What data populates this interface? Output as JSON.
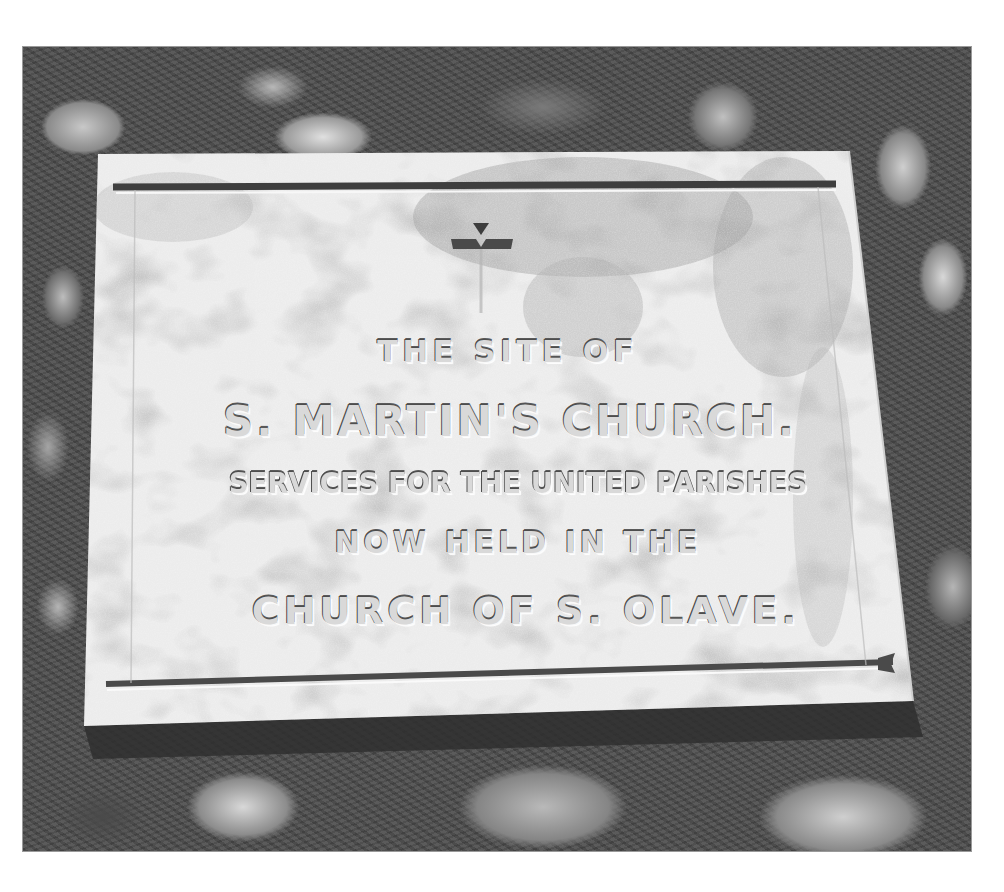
{
  "image": {
    "description": "Black-and-white photograph of a weathered carved stone plaque set into a flint wall",
    "colors": {
      "background": "#ffffff",
      "wall_dark": "#4b4b4b",
      "plaque_stone": "#e6e6e6",
      "carved_groove": "#4d4d4d"
    }
  },
  "plaque": {
    "symbol": "cross-icon",
    "inscription": [
      "THE SITE OF",
      "S. MARTIN'S CHURCH.",
      "SERVICES FOR THE UNITED PARISHES",
      "NOW HELD IN THE",
      "CHURCH OF S. OLAVE."
    ]
  }
}
